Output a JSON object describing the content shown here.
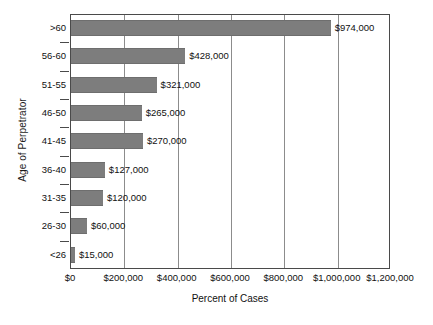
{
  "chart_data": {
    "type": "bar",
    "orientation": "horizontal",
    "title": "",
    "xlabel": "Percent of Cases",
    "ylabel": "Age of Perpetrator",
    "xlim": [
      0,
      1200000
    ],
    "grid": true,
    "legend": "none",
    "xticks": [
      {
        "value": 0,
        "label": "$0"
      },
      {
        "value": 200000,
        "label": "$200,000"
      },
      {
        "value": 400000,
        "label": "$400,000"
      },
      {
        "value": 600000,
        "label": "$600,000"
      },
      {
        "value": 800000,
        "label": "$800,000"
      },
      {
        "value": 1000000,
        "label": "$1,000,000"
      },
      {
        "value": 1200000,
        "label": "$1,200,000"
      }
    ],
    "categories": [
      ">60",
      "56-60",
      "51-55",
      "46-50",
      "41-45",
      "36-40",
      "31-35",
      "26-30",
      "<26"
    ],
    "values": [
      974000,
      428000,
      321000,
      265000,
      270000,
      127000,
      120000,
      60000,
      15000
    ],
    "data_labels": [
      "$974,000",
      "$428,000",
      "$321,000",
      "$265,000",
      "$270,000",
      "$127,000",
      "$120,000",
      "$60,000",
      "$15,000"
    ],
    "bar_color": "#7d7d7d",
    "axis_color": "#4a4a4a",
    "gridline_color": "#8c8c8c"
  }
}
